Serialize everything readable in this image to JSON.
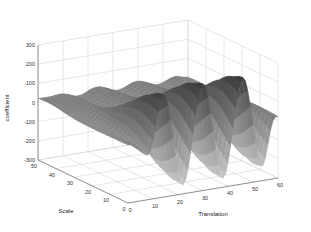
{
  "chart_data": {
    "type": "surface3d",
    "title": "",
    "xlabel": "Translation",
    "ylabel": "Scale",
    "zlabel": "coefficient",
    "xlim": [
      0,
      60
    ],
    "ylim": [
      0,
      50
    ],
    "zlim": [
      -300,
      300
    ],
    "xticks": [
      "0",
      "10",
      "20",
      "30",
      "40",
      "50",
      "60"
    ],
    "yticks": [
      "0",
      "10",
      "20",
      "30",
      "40",
      "50"
    ],
    "zticks": [
      "-300",
      "-200",
      "-100",
      "0",
      "100",
      "200",
      "300"
    ],
    "grid": true,
    "colormap": "gray",
    "series": [
      {
        "name": "peaks",
        "translation": [
          14,
          22,
          30,
          38,
          46,
          55
        ],
        "coefficient": [
          120,
          190,
          195,
          205,
          215,
          110
        ]
      },
      {
        "name": "troughs",
        "translation": [
          18,
          26,
          34,
          42,
          50
        ],
        "coefficient": [
          -280,
          -270,
          -265,
          -255,
          -230
        ]
      }
    ]
  },
  "labels": {
    "xlabel": "Translation",
    "ylabel": "Scale",
    "zlabel": "coefficient"
  }
}
